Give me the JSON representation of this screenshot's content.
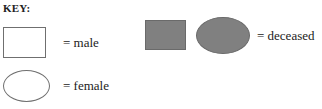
{
  "legend": {
    "title": "KEY:",
    "colors": {
      "fill_unaffected": "#ffffff",
      "fill_deceased": "#808080",
      "outline": "#6f6f6f",
      "background": "#ffffff",
      "text": "#222222"
    },
    "entries": [
      {
        "id": "male",
        "shape": "rect",
        "fill": "open",
        "label": "= male"
      },
      {
        "id": "female",
        "shape": "ellipse",
        "fill": "open",
        "label": "= female"
      },
      {
        "id": "deceased",
        "shape": "rect-and-ellipse",
        "fill": "filled",
        "label": "= deceased"
      }
    ]
  }
}
